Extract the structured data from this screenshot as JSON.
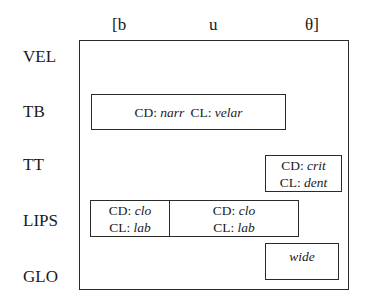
{
  "segments": [
    {
      "label": "[b"
    },
    {
      "label": "u"
    },
    {
      "label": "θ]"
    }
  ],
  "tiers": [
    {
      "label": "VEL"
    },
    {
      "label": "TB"
    },
    {
      "label": "TT"
    },
    {
      "label": "LIPS"
    },
    {
      "label": "GLO"
    }
  ],
  "gestures": {
    "tb": {
      "cd_key": "CD:",
      "cd_value": "narr",
      "cl_key": "CL:",
      "cl_value": "velar"
    },
    "tt": {
      "cd_key": "CD:",
      "cd_value": "crit",
      "cl_key": "CL:",
      "cl_value": "dent"
    },
    "lips_1": {
      "cd_key": "CD:",
      "cd_value": "clo",
      "cl_key": "CL:",
      "cl_value": "lab"
    },
    "lips_2": {
      "cd_key": "CD:",
      "cd_value": "clo",
      "cl_key": "CL:",
      "cl_value": "lab"
    },
    "glo": {
      "value": "wide"
    }
  }
}
